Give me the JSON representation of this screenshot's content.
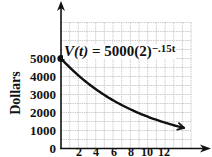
{
  "chart_data": {
    "type": "line",
    "title": "",
    "formula_label": {
      "lhs": "V(t)",
      "equals": " = ",
      "base": "5000(2)",
      "exponent": "−.15t"
    },
    "xlabel": "",
    "ylabel": "Dollars",
    "x_ticks": [
      "2",
      "4",
      "6",
      "8",
      "10",
      "12"
    ],
    "y_ticks": [
      "0",
      "1000",
      "2000",
      "3000",
      "4000",
      "5000"
    ],
    "xlim": [
      0,
      15
    ],
    "ylim": [
      0,
      7000
    ],
    "grid": true,
    "legend": null,
    "series": [
      {
        "name": "V(t) = 5000(2)^(-.15t)",
        "x": [
          0,
          2,
          4,
          6,
          8,
          10,
          12,
          14
        ],
        "values": [
          5000,
          4061,
          3299,
          2679,
          2176,
          1768,
          1436,
          1166
        ],
        "start_point_marker": true,
        "end_arrow": true
      }
    ],
    "colors": {
      "curve": "#111111",
      "grid": "#b8b8b8",
      "axis": "#111111"
    }
  }
}
